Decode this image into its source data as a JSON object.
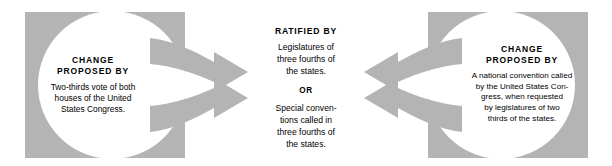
{
  "diagram": {
    "colors": {
      "shape_gray": "#b4b4b4",
      "background": "#ffffff",
      "text": "#000000"
    },
    "left_panel": {
      "heading_line1": "CHANGE",
      "heading_line2": "PROPOSED BY",
      "body_line1": "Two-thirds vote of both",
      "body_line2": "houses of the United",
      "body_line3": "States Congress."
    },
    "center_panel": {
      "heading": "RATIFIED BY",
      "option_a_line1": "Legislatures of",
      "option_a_line2": "three fourths of",
      "option_a_line3": "the states.",
      "or_label": "OR",
      "option_b_line1": "Special conven-",
      "option_b_line2": "tions called in",
      "option_b_line3": "three fourths of",
      "option_b_line4": "the states."
    },
    "right_panel": {
      "heading_line1": "CHANGE",
      "heading_line2": "PROPOSED BY",
      "body_line1": "A national convention called",
      "body_line2": "by the United States Con-",
      "body_line3": "gress, when requested",
      "body_line4": "by legislatures of two",
      "body_line5": "thirds of the states."
    },
    "arrows": {
      "left_upper": "arrow-right-upper",
      "left_lower": "arrow-right-lower",
      "right_upper": "arrow-left-upper",
      "right_lower": "arrow-left-lower"
    }
  }
}
